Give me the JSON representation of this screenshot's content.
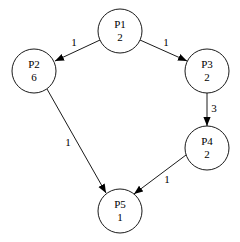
{
  "diagram": {
    "type": "directed-graph",
    "nodes": [
      {
        "id": "P1",
        "label": "P1",
        "value": "2",
        "cx": 120,
        "cy": 31
      },
      {
        "id": "P2",
        "label": "P2",
        "value": "6",
        "cx": 34,
        "cy": 71
      },
      {
        "id": "P3",
        "label": "P3",
        "value": "2",
        "cx": 207,
        "cy": 71
      },
      {
        "id": "P4",
        "label": "P4",
        "value": "2",
        "cx": 207,
        "cy": 148
      },
      {
        "id": "P5",
        "label": "P5",
        "value": "1",
        "cx": 120,
        "cy": 211
      }
    ],
    "edges": [
      {
        "from": "P1",
        "to": "P2",
        "weight": "1"
      },
      {
        "from": "P1",
        "to": "P3",
        "weight": "1"
      },
      {
        "from": "P3",
        "to": "P4",
        "weight": "3"
      },
      {
        "from": "P2",
        "to": "P5",
        "weight": "1"
      },
      {
        "from": "P4",
        "to": "P5",
        "weight": "1"
      }
    ],
    "colors": {
      "stroke": "#000000",
      "fill": "#ffffff",
      "background": "#ffffff"
    }
  }
}
